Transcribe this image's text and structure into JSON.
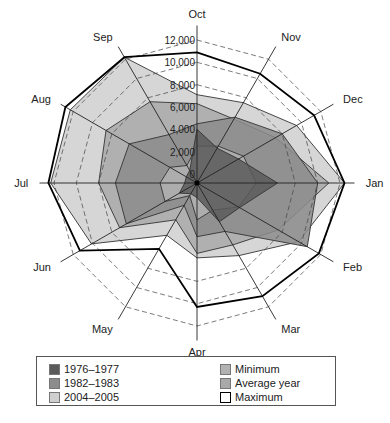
{
  "chart_data": {
    "type": "radar",
    "title": "",
    "axes": [
      "Oct",
      "Nov",
      "Dec",
      "Jan",
      "Feb",
      "Mar",
      "Apr",
      "May",
      "Jun",
      "Jul",
      "Aug",
      "Sep"
    ],
    "radial_range": [
      0,
      12000
    ],
    "radial_ticks": [
      0,
      2000,
      4000,
      6000,
      8000,
      10000,
      12000
    ],
    "radial_tick_labels": [
      "0",
      "2,000",
      "4,000",
      "6,000",
      "8,000",
      "10,000",
      "12,000"
    ],
    "dashed_rings": [
      8000,
      10000,
      12000
    ],
    "series": [
      {
        "name": "2004–2005",
        "color": "#cfcfcf",
        "values": [
          7100,
          7500,
          9500,
          12400,
          9700,
          6700,
          5900,
          4600,
          10100,
          12300,
          12300,
          12200
        ]
      },
      {
        "name": "Average year",
        "color": "#a9a9a9",
        "values": [
          6300,
          5800,
          7300,
          11000,
          7600,
          5600,
          5500,
          3000,
          7200,
          8000,
          8600,
          7600
        ]
      },
      {
        "name": "1982–1983",
        "color": "#8c8c8c",
        "values": [
          4500,
          6000,
          8000,
          10000,
          10600,
          4200,
          4000,
          1500,
          6500,
          6500,
          6200,
          4200
        ]
      },
      {
        "name": "Minimum",
        "color": "#b2b2b2",
        "values": [
          2500,
          3000,
          4000,
          4500,
          3500,
          2000,
          2500,
          500,
          2500,
          2500,
          2000,
          1000
        ]
      },
      {
        "name": "1976–1977",
        "color": "#5a5a5a",
        "values": [
          4000,
          2800,
          3500,
          6400,
          3600,
          3200,
          500,
          300,
          1000,
          300,
          300,
          500
        ]
      },
      {
        "name": "Maximum",
        "color": "none",
        "stroke": "#000000",
        "values": [
          10900,
          10500,
          11300,
          12400,
          11800,
          10900,
          10300,
          6000,
          11300,
          12500,
          12800,
          12200
        ]
      }
    ],
    "legend": {
      "placement": "bottom",
      "entries": [
        {
          "label": "1976–1977",
          "color": "#5a5a5a"
        },
        {
          "label": "1982–1983",
          "color": "#8c8c8c"
        },
        {
          "label": "2004–2005",
          "color": "#cfcfcf"
        },
        {
          "label": "Minimum",
          "color": "#b2b2b2"
        },
        {
          "label": "Average year",
          "color": "#a9a9a9"
        },
        {
          "label": "Maximum",
          "color": "#ffffff"
        }
      ]
    }
  }
}
